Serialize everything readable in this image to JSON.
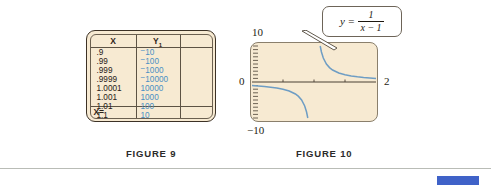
{
  "figure9": {
    "caption": "FIGURE 9",
    "table": {
      "headers": [
        "X",
        "Y1"
      ],
      "header_x": "X",
      "header_y_base": "Y",
      "header_y_sub": "1",
      "rows": [
        {
          "x": ".9",
          "y": "10",
          "y_negative": true
        },
        {
          "x": ".99",
          "y": "100",
          "y_negative": true
        },
        {
          "x": ".999",
          "y": "1000",
          "y_negative": true
        },
        {
          "x": ".9999",
          "y": "10000",
          "y_negative": true
        },
        {
          "x": "1.0001",
          "y": "10000",
          "y_negative": false
        },
        {
          "x": "1.001",
          "y": "1000",
          "y_negative": false
        },
        {
          "x": "1.01",
          "y": "100",
          "y_negative": false
        },
        {
          "x": "1.1",
          "y": "10",
          "y_negative": false
        }
      ],
      "x_column_text": ".9\n.99\n.999\n.9999\n1.0001\n1.001\n1.01\n1.1",
      "status_row": "X="
    },
    "colors": {
      "screen_background": "#f7ead2",
      "screen_border": "#3d3226",
      "x_text": "#262018",
      "y_text": "#4b8fc4"
    }
  },
  "figure10": {
    "caption": "FIGURE 10",
    "callout_formula": {
      "lhs": "y =",
      "numerator": "1",
      "denominator": "x − 1"
    },
    "axis_labels": {
      "y_max": "10",
      "y_min": "−10",
      "origin": "0",
      "x_max": "2"
    },
    "colors": {
      "screen_background": "#f7ead2",
      "curve": "#6e9dc4",
      "axis": "#4a4034",
      "callout_border": "#6d6458"
    }
  },
  "chart_data": {
    "type": "line",
    "xlabel": "x",
    "ylabel": "y",
    "xlim": [
      0,
      2
    ],
    "ylim": [
      -10,
      10
    ],
    "grid": false,
    "legend": null,
    "asymptote_vertical_x": 1,
    "asymptote_horizontal_y": 0,
    "annotations": [
      "y = 1/(x - 1)"
    ],
    "xticks": [
      0,
      0.5,
      1,
      1.5,
      2
    ],
    "yticks": [
      -10,
      0,
      10
    ],
    "series": [
      {
        "name": "left branch",
        "x": [
          0.0,
          0.1,
          0.2,
          0.3,
          0.4,
          0.5,
          0.6,
          0.7,
          0.75,
          0.8,
          0.85,
          0.88,
          0.9
        ],
        "y": [
          -1.0,
          -1.11,
          -1.25,
          -1.43,
          -1.67,
          -2.0,
          -2.5,
          -3.33,
          -4.0,
          -5.0,
          -6.67,
          -8.33,
          -10.0
        ]
      },
      {
        "name": "right branch",
        "x": [
          1.1,
          1.12,
          1.15,
          1.2,
          1.25,
          1.3,
          1.4,
          1.5,
          1.6,
          1.7,
          1.8,
          1.9,
          2.0
        ],
        "y": [
          10.0,
          8.33,
          6.67,
          5.0,
          4.0,
          3.33,
          2.5,
          2.0,
          1.67,
          1.43,
          1.25,
          1.11,
          1.0
        ]
      }
    ]
  },
  "footer": {
    "accent_color": "#3f62c8",
    "rule_color": "#b9bcb6"
  }
}
